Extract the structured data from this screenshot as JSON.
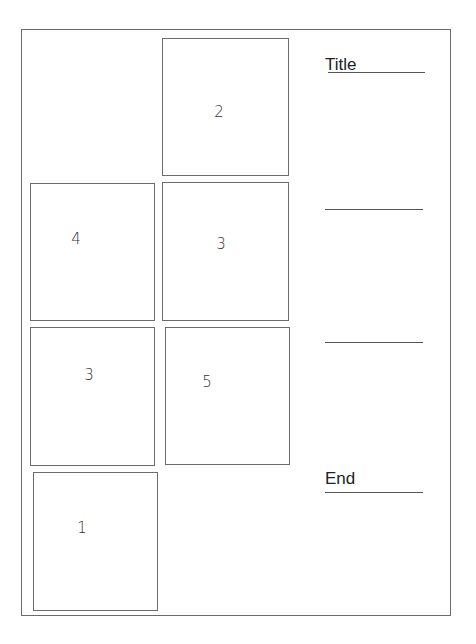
{
  "colors": {
    "stroke": "#6b6b6b",
    "text": "#222222",
    "background": "#ffffff"
  },
  "labels": {
    "title": "Title",
    "end": "End"
  },
  "panels": [
    {
      "id": "panel-a",
      "number": "2"
    },
    {
      "id": "panel-b",
      "number": "4"
    },
    {
      "id": "panel-c",
      "number": "3"
    },
    {
      "id": "panel-d",
      "number": "3"
    },
    {
      "id": "panel-e",
      "number": "5"
    },
    {
      "id": "panel-f",
      "number": "1"
    }
  ],
  "blank_lines": [
    "",
    ""
  ]
}
